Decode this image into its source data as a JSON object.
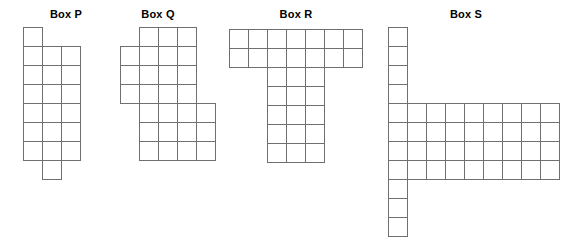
{
  "figure": {
    "background_color": "#ffffff",
    "line_color": "#6f6f6f",
    "cell_size_px": 19,
    "boxes": [
      {
        "id": "box-p",
        "label": "Box P",
        "title_center_x": 66,
        "title_y": 8,
        "origin_x": 23,
        "origin_y": 27,
        "columns": 3,
        "rows": 8,
        "cells": [
          [
            0,
            0
          ],
          [
            0,
            1
          ],
          [
            1,
            1
          ],
          [
            2,
            1
          ],
          [
            0,
            2
          ],
          [
            1,
            2
          ],
          [
            2,
            2
          ],
          [
            0,
            3
          ],
          [
            1,
            3
          ],
          [
            2,
            3
          ],
          [
            0,
            4
          ],
          [
            1,
            4
          ],
          [
            2,
            4
          ],
          [
            0,
            5
          ],
          [
            1,
            5
          ],
          [
            2,
            5
          ],
          [
            0,
            6
          ],
          [
            1,
            6
          ],
          [
            2,
            6
          ],
          [
            1,
            7
          ]
        ],
        "cell_count": 20
      },
      {
        "id": "box-q",
        "label": "Box Q",
        "title_center_x": 158,
        "title_y": 8,
        "origin_x": 120,
        "origin_y": 27,
        "columns": 5,
        "rows": 7,
        "cells": [
          [
            1,
            0
          ],
          [
            2,
            0
          ],
          [
            3,
            0
          ],
          [
            0,
            1
          ],
          [
            1,
            1
          ],
          [
            2,
            1
          ],
          [
            3,
            1
          ],
          [
            0,
            2
          ],
          [
            1,
            2
          ],
          [
            2,
            2
          ],
          [
            3,
            2
          ],
          [
            0,
            3
          ],
          [
            1,
            3
          ],
          [
            2,
            3
          ],
          [
            3,
            3
          ],
          [
            1,
            4
          ],
          [
            2,
            4
          ],
          [
            3,
            4
          ],
          [
            4,
            4
          ],
          [
            1,
            5
          ],
          [
            2,
            5
          ],
          [
            3,
            5
          ],
          [
            4,
            5
          ],
          [
            1,
            6
          ],
          [
            2,
            6
          ],
          [
            3,
            6
          ],
          [
            4,
            6
          ]
        ],
        "cell_count": 27
      },
      {
        "id": "box-r",
        "label": "Box R",
        "title_center_x": 296,
        "title_y": 8,
        "origin_x": 229,
        "origin_y": 29,
        "columns": 7,
        "rows": 7,
        "cells": [
          [
            0,
            0
          ],
          [
            1,
            0
          ],
          [
            2,
            0
          ],
          [
            3,
            0
          ],
          [
            4,
            0
          ],
          [
            5,
            0
          ],
          [
            6,
            0
          ],
          [
            0,
            1
          ],
          [
            1,
            1
          ],
          [
            2,
            1
          ],
          [
            3,
            1
          ],
          [
            4,
            1
          ],
          [
            5,
            1
          ],
          [
            6,
            1
          ],
          [
            2,
            2
          ],
          [
            3,
            2
          ],
          [
            4,
            2
          ],
          [
            2,
            3
          ],
          [
            3,
            3
          ],
          [
            4,
            3
          ],
          [
            2,
            4
          ],
          [
            3,
            4
          ],
          [
            4,
            4
          ],
          [
            2,
            5
          ],
          [
            3,
            5
          ],
          [
            4,
            5
          ],
          [
            2,
            6
          ],
          [
            3,
            6
          ],
          [
            4,
            6
          ]
        ],
        "cell_count": 29
      },
      {
        "id": "box-s",
        "label": "Box S",
        "title_center_x": 466,
        "title_y": 8,
        "origin_x": 388,
        "origin_y": 27,
        "columns": 9,
        "rows": 11,
        "cells": [
          [
            0,
            0
          ],
          [
            0,
            1
          ],
          [
            0,
            2
          ],
          [
            0,
            3
          ],
          [
            0,
            4
          ],
          [
            1,
            4
          ],
          [
            2,
            4
          ],
          [
            3,
            4
          ],
          [
            4,
            4
          ],
          [
            5,
            4
          ],
          [
            6,
            4
          ],
          [
            7,
            4
          ],
          [
            8,
            4
          ],
          [
            0,
            5
          ],
          [
            1,
            5
          ],
          [
            2,
            5
          ],
          [
            3,
            5
          ],
          [
            4,
            5
          ],
          [
            5,
            5
          ],
          [
            6,
            5
          ],
          [
            7,
            5
          ],
          [
            8,
            5
          ],
          [
            0,
            6
          ],
          [
            1,
            6
          ],
          [
            2,
            6
          ],
          [
            3,
            6
          ],
          [
            4,
            6
          ],
          [
            5,
            6
          ],
          [
            6,
            6
          ],
          [
            7,
            6
          ],
          [
            8,
            6
          ],
          [
            0,
            7
          ],
          [
            1,
            7
          ],
          [
            2,
            7
          ],
          [
            3,
            7
          ],
          [
            4,
            7
          ],
          [
            5,
            7
          ],
          [
            6,
            7
          ],
          [
            7,
            7
          ],
          [
            8,
            7
          ],
          [
            0,
            8
          ],
          [
            0,
            9
          ],
          [
            0,
            10
          ]
        ],
        "cell_count": 43
      }
    ]
  }
}
